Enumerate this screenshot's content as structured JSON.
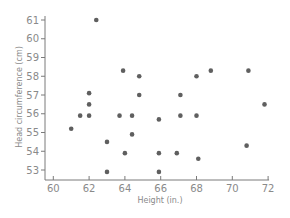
{
  "chart_data": {
    "type": "scatter",
    "title": "",
    "xlabel": "Height (in.)",
    "ylabel": "Head circumference (cm)",
    "xlim": [
      59.5,
      72
    ],
    "ylim": [
      52.5,
      61.2
    ],
    "xticks": [
      60,
      62,
      64,
      66,
      68,
      70,
      72
    ],
    "yticks": [
      53,
      54,
      55,
      56,
      57,
      58,
      59,
      60,
      61
    ],
    "grid": false,
    "legend": null,
    "marker_color": "#5f5f5f",
    "series": [
      {
        "name": "Students",
        "points": [
          {
            "x": 61.0,
            "y": 55.2
          },
          {
            "x": 61.5,
            "y": 55.9
          },
          {
            "x": 62.0,
            "y": 55.9
          },
          {
            "x": 62.0,
            "y": 56.5
          },
          {
            "x": 62.0,
            "y": 57.1
          },
          {
            "x": 62.4,
            "y": 61.0
          },
          {
            "x": 63.0,
            "y": 54.5
          },
          {
            "x": 63.0,
            "y": 52.9
          },
          {
            "x": 63.7,
            "y": 55.9
          },
          {
            "x": 63.9,
            "y": 58.3
          },
          {
            "x": 64.0,
            "y": 53.9
          },
          {
            "x": 64.4,
            "y": 55.9
          },
          {
            "x": 64.4,
            "y": 54.9
          },
          {
            "x": 64.8,
            "y": 58.0
          },
          {
            "x": 64.8,
            "y": 57.0
          },
          {
            "x": 65.9,
            "y": 55.7
          },
          {
            "x": 65.9,
            "y": 53.9
          },
          {
            "x": 65.9,
            "y": 52.9
          },
          {
            "x": 66.9,
            "y": 53.9
          },
          {
            "x": 67.1,
            "y": 57.0
          },
          {
            "x": 67.1,
            "y": 55.9
          },
          {
            "x": 68.0,
            "y": 58.0
          },
          {
            "x": 68.0,
            "y": 55.9
          },
          {
            "x": 68.1,
            "y": 53.6
          },
          {
            "x": 68.8,
            "y": 58.3
          },
          {
            "x": 70.8,
            "y": 54.3
          },
          {
            "x": 70.9,
            "y": 58.3
          },
          {
            "x": 71.8,
            "y": 56.5
          }
        ]
      }
    ]
  }
}
